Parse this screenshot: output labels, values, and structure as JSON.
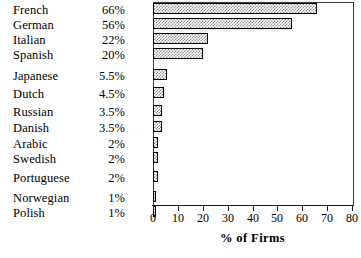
{
  "chart_data": {
    "type": "bar",
    "orientation": "horizontal",
    "title": "",
    "xlabel": "% of Firms",
    "ylabel": "",
    "xlim": [
      0,
      80
    ],
    "xticks": [
      0,
      10,
      20,
      30,
      40,
      50,
      60,
      70,
      80
    ],
    "xtick_labels": [
      "0",
      "10",
      "20",
      "30",
      "40",
      "50",
      "60",
      "70",
      "80"
    ],
    "grid": false,
    "legend": null,
    "bar_fill": "checkerboard-hatch",
    "bar_edge_color": "#000000",
    "categories": [
      "French",
      "German",
      "Italian",
      "Spanish",
      "Japanese",
      "Dutch",
      "Russian",
      "Danish",
      "Arabic",
      "Swedish",
      "Portuguese",
      "Norwegian",
      "Polish"
    ],
    "values": [
      66,
      56,
      22,
      20,
      5.5,
      4.5,
      3.5,
      3.5,
      2,
      2,
      2,
      1,
      1
    ],
    "value_labels": [
      "66%",
      "56%",
      "22%",
      "20%",
      "5.5%",
      "4.5%",
      "3.5%",
      "3.5%",
      "2%",
      "2%",
      "2%",
      "1%",
      "1%"
    ]
  },
  "rows": [
    {
      "label": "French",
      "value_label": "66%",
      "value": 66,
      "top": 4,
      "gap_after": false
    },
    {
      "label": "German",
      "value_label": "56%",
      "value": 56,
      "top": 19,
      "gap_after": false
    },
    {
      "label": "Italian",
      "value_label": "22%",
      "value": 22,
      "top": 34,
      "gap_after": false
    },
    {
      "label": "Spanish",
      "value_label": "20%",
      "value": 20,
      "top": 49,
      "gap_after": true
    },
    {
      "label": "Japanese",
      "value_label": "5.5%",
      "value": 5.5,
      "top": 70,
      "gap_after": false
    },
    {
      "label": "Dutch",
      "value_label": "4.5%",
      "value": 4.5,
      "top": 88,
      "gap_after": false
    },
    {
      "label": "Russian",
      "value_label": "3.5%",
      "value": 3.5,
      "top": 106,
      "gap_after": false
    },
    {
      "label": "Danish",
      "value_label": "3.5%",
      "value": 3.5,
      "top": 122,
      "gap_after": false
    },
    {
      "label": "Arabic",
      "value_label": "2%",
      "value": 2,
      "top": 138,
      "gap_after": false
    },
    {
      "label": "Swedish",
      "value_label": "2%",
      "value": 2,
      "top": 153,
      "gap_after": true
    },
    {
      "label": "Portuguese",
      "value_label": "2%",
      "value": 2,
      "top": 172,
      "gap_after": true
    },
    {
      "label": "Norwegian",
      "value_label": "1%",
      "value": 1,
      "top": 192,
      "gap_after": false
    },
    {
      "label": "Polish",
      "value_label": "1%",
      "value": 1,
      "top": 207,
      "gap_after": false
    }
  ]
}
